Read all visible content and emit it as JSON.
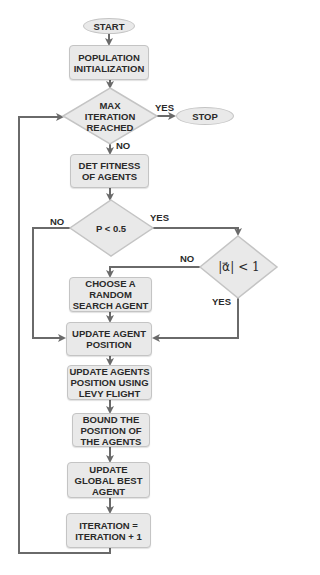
{
  "flowchart": {
    "start": "START",
    "stop": "STOP",
    "population_init": "POPULATION INITIALIZATION",
    "max_iter_line1": "MAX",
    "max_iter_line2": "ITERATION",
    "max_iter_line3": "REACHED",
    "det_fitness": "DET FITNESS OF AGENTS",
    "p_condition": "P < 0.5",
    "alpha_condition": "|α⃗| < 1",
    "choose_random": "CHOOSE A RANDOM SEARCH AGENT",
    "update_position": "UPDATE AGENT POSITION",
    "levy_flight": "UPDATE AGENTS POSITION USING LEVY FLIGHT",
    "bound_position": "BOUND THE POSITION OF THE AGENTS",
    "update_global_best": "UPDATE GLOBAL BEST AGENT",
    "iteration_increment": "ITERATION = ITERATION + 1",
    "labels": {
      "max_yes": "YES",
      "max_no": "NO",
      "p_yes": "YES",
      "p_no": "NO",
      "alpha_no": "NO",
      "alpha_yes": "YES"
    }
  },
  "colors": {
    "fill": "#e9e9e9",
    "border": "#c4c4c4",
    "line": "#6a6a6a",
    "text": "#2a2a2a"
  }
}
